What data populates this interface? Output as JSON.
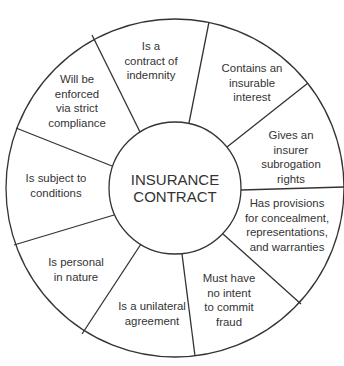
{
  "diagram": {
    "type": "radial-wheel",
    "colors": {
      "line": "#333333",
      "text": "#333333",
      "background": "#ffffff"
    },
    "center": {
      "lines": [
        "INSURANCE",
        "CONTRACT"
      ]
    },
    "segments": [
      {
        "id": "indemnity",
        "lines": [
          "Is a",
          "contract of",
          "indemnity"
        ]
      },
      {
        "id": "insurable-interest",
        "lines": [
          "Contains an",
          "insurable",
          "interest"
        ]
      },
      {
        "id": "subrogation",
        "lines": [
          "Gives an",
          "insurer",
          "subrogation",
          "rights"
        ]
      },
      {
        "id": "provisions",
        "lines": [
          "Has provisions",
          "for concealment,",
          "representations,",
          "and warranties"
        ]
      },
      {
        "id": "no-fraud",
        "lines": [
          "Must have",
          "no intent",
          "to commit",
          "fraud"
        ]
      },
      {
        "id": "unilateral",
        "lines": [
          "Is a unilateral",
          "agreement"
        ]
      },
      {
        "id": "personal",
        "lines": [
          "Is personal",
          "in nature"
        ]
      },
      {
        "id": "conditions",
        "lines": [
          "Is subject to",
          "conditions"
        ]
      },
      {
        "id": "strict-compliance",
        "lines": [
          "Will be",
          "enforced",
          "via strict",
          "compliance"
        ]
      }
    ]
  }
}
